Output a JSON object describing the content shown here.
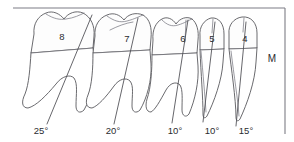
{
  "figure": {
    "kind": "dental-inclination-diagram",
    "arch": "mandibular-right-posterior-segment",
    "side_marker": "M",
    "background_color": "#ffffff",
    "outline_color": "#5a5a5f",
    "frame_color": "#7d7d85",
    "root_shade_color": "#e6e6e8",
    "text_color": "#2b2b2f"
  },
  "teeth": [
    {
      "number": "8",
      "type": "third-molar",
      "roots": 2,
      "angle_label": "25°",
      "angle_value": 25,
      "num_x": 62,
      "num_y": 40,
      "angle_x": 41,
      "angle_y": 134,
      "axis": {
        "x1": 92,
        "y1": 15,
        "x2": 47,
        "y2": 124
      }
    },
    {
      "number": "7",
      "type": "second-molar",
      "roots": 2,
      "angle_label": "20°",
      "angle_value": 20,
      "num_x": 127,
      "num_y": 42,
      "angle_x": 113,
      "angle_y": 134,
      "axis": {
        "x1": 138,
        "y1": 18,
        "x2": 114,
        "y2": 124
      }
    },
    {
      "number": "6",
      "type": "first-molar",
      "roots": 2,
      "angle_label": "10°",
      "angle_value": 10,
      "num_x": 183,
      "num_y": 42,
      "angle_x": 175,
      "angle_y": 134,
      "axis": {
        "x1": 188,
        "y1": 20,
        "x2": 172,
        "y2": 123
      }
    },
    {
      "number": "5",
      "type": "second-premolar",
      "roots": 1,
      "angle_label": "10°",
      "angle_value": 10,
      "num_x": 212,
      "num_y": 42,
      "angle_x": 212,
      "angle_y": 134,
      "axis": {
        "x1": 215,
        "y1": 22,
        "x2": 203,
        "y2": 122
      }
    },
    {
      "number": "4",
      "type": "first-premolar",
      "roots": 1,
      "angle_label": "15°",
      "angle_value": 15,
      "num_x": 245,
      "num_y": 42,
      "angle_x": 246,
      "angle_y": 134,
      "axis": {
        "x1": 246,
        "y1": 22,
        "x2": 236,
        "y2": 126
      }
    }
  ],
  "side_label": {
    "text": "M",
    "x": 272,
    "y": 62
  }
}
